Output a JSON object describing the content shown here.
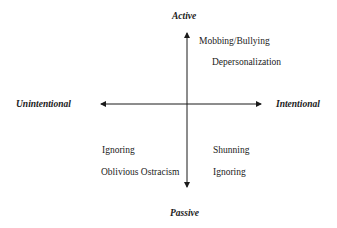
{
  "axes": {
    "top": "Active",
    "bottom": "Passive",
    "left": "Unintentional",
    "right": "Intentional"
  },
  "quadrants": {
    "top_right": [
      "Mobbing/Bullying",
      "Depersonalization"
    ],
    "bottom_left": [
      "Ignoring",
      "Oblivious Ostracism"
    ],
    "bottom_right": [
      "Shunning",
      "Ignoring"
    ]
  },
  "colors": {
    "line": "#1a1a1a",
    "text": "#1a1a1a",
    "background": "#ffffff"
  }
}
